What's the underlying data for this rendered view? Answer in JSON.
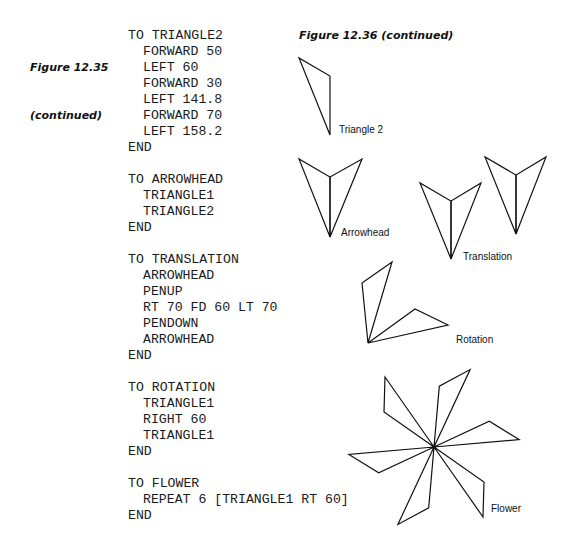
{
  "left_caption": {
    "title": "Figure 12.35",
    "subtitle": "(continued)"
  },
  "right_caption": "Figure 12.36 (continued)",
  "procedures": [
    {
      "header": "TO TRIANGLE2",
      "body": [
        "FORWARD 50",
        "LEFT 60",
        "FORWARD 30",
        "LEFT 141.8",
        "FORWARD 70",
        "LEFT 158.2"
      ],
      "end": "END"
    },
    {
      "header": "TO ARROWHEAD",
      "body": [
        "TRIANGLE1",
        "TRIANGLE2"
      ],
      "end": "END"
    },
    {
      "header": "TO TRANSLATION",
      "body": [
        "ARROWHEAD",
        "PENUP",
        "RT 70 FD 60 LT 70",
        "PENDOWN",
        "ARROWHEAD"
      ],
      "end": "END"
    },
    {
      "header": "TO ROTATION",
      "body": [
        "TRIANGLE1",
        "RIGHT 60",
        "TRIANGLE1"
      ],
      "end": "END"
    },
    {
      "header": "TO FLOWER",
      "body": [
        "REPEAT 6 [TRIANGLE1 RT 60]"
      ],
      "end": "END"
    }
  ],
  "figure_labels": {
    "triangle2": "Triangle 2",
    "arrowhead": "Arrowhead",
    "translation": "Translation",
    "rotation": "Rotation",
    "flower": "Flower"
  }
}
